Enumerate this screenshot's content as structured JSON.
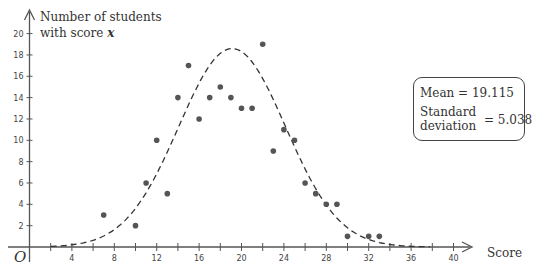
{
  "chart_data": {
    "type": "scatter",
    "title": "",
    "ylabel": "Number of students with score x",
    "ylabel_lines": [
      "Number of students",
      "with score"
    ],
    "ylabel_var": "x",
    "xlabel": "Score",
    "origin_label": "O",
    "xlim": [
      0,
      42
    ],
    "ylim": [
      0,
      21
    ],
    "x_ticks": [
      4,
      8,
      12,
      16,
      20,
      24,
      28,
      32,
      36,
      40
    ],
    "y_ticks": [
      2,
      4,
      6,
      8,
      10,
      12,
      14,
      16,
      18,
      20
    ],
    "grid": false,
    "series": [
      {
        "name": "Observed scores",
        "style": "dots",
        "points": [
          [
            7,
            3
          ],
          [
            10,
            2
          ],
          [
            11,
            6
          ],
          [
            12,
            10
          ],
          [
            13,
            5
          ],
          [
            14,
            14
          ],
          [
            15,
            17
          ],
          [
            16,
            12
          ],
          [
            17,
            14
          ],
          [
            18,
            15
          ],
          [
            19,
            14
          ],
          [
            20,
            13
          ],
          [
            21,
            13
          ],
          [
            22,
            19
          ],
          [
            23,
            9
          ],
          [
            24,
            11
          ],
          [
            25,
            10
          ],
          [
            26,
            6
          ],
          [
            27,
            5
          ],
          [
            28,
            4
          ],
          [
            29,
            4
          ],
          [
            30,
            1
          ],
          [
            32,
            1
          ],
          [
            33,
            1
          ]
        ]
      },
      {
        "name": "Normal curve fit",
        "style": "dashed",
        "mean": 19.115,
        "std": 5.038,
        "peak": 18.6,
        "x_range": [
          2,
          38
        ]
      }
    ],
    "annotations": {
      "mean_label": "Mean",
      "mean_value": "19.115",
      "std_label_line1": "Standard",
      "std_label_line2": "deviation",
      "std_value": "5.038"
    }
  },
  "stats": {
    "mean_text": "Mean  =  19.115",
    "std_label": "Standard deviation",
    "std_value_text": "=  5.038"
  }
}
